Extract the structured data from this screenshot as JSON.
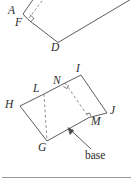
{
  "figure": {
    "kind": "geometry-diagram",
    "colors": {
      "ink": "#4a4a4a",
      "label_ink": "#2b2b2b",
      "background": "#ffffff",
      "rule": "#9a9a9a"
    },
    "stroke_width": 0.9
  },
  "top_figure": {
    "name": "parallelogram-ABDF-partial",
    "labels": [
      {
        "id": "A",
        "text": "A",
        "x": 9,
        "y": 7
      },
      {
        "id": "F",
        "text": "F",
        "x": 16,
        "y": 19
      },
      {
        "id": "D",
        "text": "D",
        "x": 52,
        "y": 44
      }
    ],
    "vertices": {
      "A": {
        "x": 23,
        "y": 14
      },
      "F": {
        "x": 28,
        "y": 19
      },
      "D": {
        "x": 58,
        "y": 42
      },
      "B": {
        "x": 40,
        "y": -10
      },
      "C": {
        "x": 128,
        "y": -2
      }
    },
    "solid_edges": [
      {
        "from": "A",
        "to": "B"
      },
      {
        "from": "A",
        "to": "F"
      },
      {
        "from": "F",
        "to": "D"
      },
      {
        "from": "D",
        "to": "C"
      }
    ],
    "dashed_altitude": {
      "from_x": 44,
      "from_y": 0,
      "to_x": 28,
      "to_y": 19
    },
    "right_angle_at": {
      "x": 28,
      "y": 19
    }
  },
  "bottom_figure": {
    "name": "parallelogram-HLIJ-with-base",
    "labels": [
      {
        "id": "I",
        "text": "I",
        "x": 77,
        "y": 65
      },
      {
        "id": "N",
        "text": "N",
        "x": 54,
        "y": 77
      },
      {
        "id": "L",
        "text": "L",
        "x": 34,
        "y": 85
      },
      {
        "id": "H",
        "text": "H",
        "x": 6,
        "y": 101
      },
      {
        "id": "J",
        "text": "J",
        "x": 110,
        "y": 107
      },
      {
        "id": "M",
        "text": "M",
        "x": 92,
        "y": 117
      },
      {
        "id": "G",
        "text": "G",
        "x": 39,
        "y": 143
      }
    ],
    "vertices": {
      "H": {
        "x": 20,
        "y": 106
      },
      "L": {
        "x": 44,
        "y": 94
      },
      "N": {
        "x": 65,
        "y": 83
      },
      "I": {
        "x": 81,
        "y": 75
      },
      "J": {
        "x": 107,
        "y": 113
      },
      "M": {
        "x": 89,
        "y": 117
      },
      "G": {
        "x": 47,
        "y": 141
      }
    },
    "solid_edges": [
      {
        "from": "H",
        "to": "L"
      },
      {
        "from": "L",
        "to": "N"
      },
      {
        "from": "N",
        "to": "I"
      },
      {
        "from": "I",
        "to": "J"
      },
      {
        "from": "J",
        "to": "M"
      },
      {
        "from": "M",
        "to": "G"
      },
      {
        "from": "G",
        "to": "H"
      }
    ],
    "dashed_altitudes": [
      {
        "id": "L-to-G",
        "from_x": 44,
        "from_y": 94,
        "to_x": 47,
        "to_y": 141
      },
      {
        "id": "N-to-M",
        "from_x": 65,
        "from_y": 83,
        "to_x": 89,
        "to_y": 117
      }
    ],
    "right_angle_marks": [
      {
        "x": 65,
        "y": 83
      },
      {
        "x": 89,
        "y": 117
      }
    ],
    "base_annotation": {
      "text": "base",
      "label_x": 85,
      "label_y": 151,
      "arrow_from_x": 90,
      "arrow_from_y": 148,
      "arrow_to_x": 68,
      "arrow_to_y": 128
    }
  },
  "footer_rule": {
    "y": 177,
    "x1": 2,
    "x2": 131
  }
}
